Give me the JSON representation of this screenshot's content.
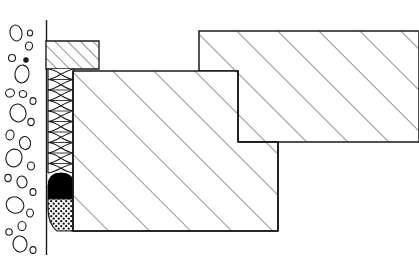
{
  "document": {
    "title": "Construction Joint Section Detail",
    "drawing_type": "architectural-section-detail",
    "width": 419,
    "height": 269,
    "background_color": "#ffffff",
    "line_color": "#1a1a1a"
  },
  "colors": {
    "outline": "#1a1a1a",
    "hatch": "#3a3a3a",
    "sealant_black": "#000000",
    "background": "#ffffff",
    "stipple": "#111111"
  },
  "regions": [
    {
      "id": "aggregate-fill",
      "name": "Aggregate / Gravel Fill",
      "fill_pattern": "pebble-outlines",
      "bounds": {
        "x": 2,
        "y": 22,
        "width": 44,
        "height": 232
      }
    },
    {
      "id": "wall-line",
      "name": "Vertical Wall Reference Line",
      "fill_pattern": "single-line",
      "bounds": {
        "x": 46,
        "y": 20,
        "width": 1,
        "height": 235
      }
    },
    {
      "id": "top-left-block",
      "name": "Upper Left Hatched Member",
      "fill_pattern": "diagonal-hatch-dense",
      "hatch_spacing": 9,
      "hatch_angle": 45,
      "bounds": {
        "x": 46,
        "y": 41,
        "width": 53,
        "height": 28
      }
    },
    {
      "id": "joint-filler",
      "name": "Coiled Joint Filler Strip",
      "fill_pattern": "coil-spring",
      "bounds": {
        "x": 48,
        "y": 69,
        "width": 26,
        "height": 104
      }
    },
    {
      "id": "sealant-bead",
      "name": "Black Sealant Bead",
      "fill_pattern": "solid-black",
      "bounds": {
        "x": 48,
        "y": 173,
        "width": 26,
        "height": 26
      }
    },
    {
      "id": "backer-rod",
      "name": "Stippled Backer Rod",
      "fill_pattern": "cross-stipple",
      "bounds": {
        "x": 48,
        "y": 199,
        "width": 26,
        "height": 32
      }
    },
    {
      "id": "main-block",
      "name": "Main Hatched Concrete Block",
      "fill_pattern": "diagonal-hatch",
      "hatch_spacing": 29,
      "hatch_angle": 45,
      "bounds": {
        "x": 73,
        "y": 71,
        "width": 205,
        "height": 160
      }
    },
    {
      "id": "upper-right-block",
      "name": "Upper Right Hatched Concrete Block",
      "fill_pattern": "diagonal-hatch",
      "hatch_spacing": 29,
      "hatch_angle": 45,
      "bounds": {
        "x": 199,
        "y": 31,
        "width": 220,
        "height": 111
      }
    }
  ],
  "geometry": {
    "wall_line": {
      "x": 46.5,
      "y_top": 20,
      "y_bottom": 255
    },
    "top_left_block_path": "M46,41 L99,41 L99,69 L46,69 Z",
    "filler_strip": {
      "x_left": 48,
      "x_right": 74,
      "y_top": 69,
      "y_bottom": 173
    },
    "sealant_top_y": 173,
    "sealant_bottom_y": 199,
    "backer_bottom_y": 231,
    "main_block_path": "M73,71 L238,71 L238,142 L278,142 L278,231 L73,231 Z",
    "upper_right_block_path": "M199,31 L419,31 L419,142 L238,142 L238,71 L199,71 Z",
    "step_inner_corner": {
      "x": 238,
      "y": 142
    },
    "main_block_right_edge_x": 278,
    "main_block_bottom_y": 231
  },
  "pebbles": [
    {
      "cx": 16,
      "cy": 33,
      "rx": 6,
      "ry": 8,
      "rot": -12
    },
    {
      "cx": 29,
      "cy": 46,
      "rx": 3.5,
      "ry": 4,
      "rot": 10
    },
    {
      "cx": 12,
      "cy": 58,
      "rx": 3.5,
      "ry": 3.5,
      "rot": 0
    },
    {
      "cx": 26,
      "cy": 60,
      "rx": 2.2,
      "ry": 2.2,
      "rot": 0,
      "solid": true
    },
    {
      "cx": 22,
      "cy": 74,
      "rx": 7,
      "ry": 9,
      "rot": 8
    },
    {
      "cx": 10,
      "cy": 93,
      "rx": 4.5,
      "ry": 4,
      "rot": -20
    },
    {
      "cx": 23,
      "cy": 94,
      "rx": 3.8,
      "ry": 3.4,
      "rot": 15
    },
    {
      "cx": 33,
      "cy": 101,
      "rx": 3,
      "ry": 3.4,
      "rot": 0
    },
    {
      "cx": 18,
      "cy": 113,
      "rx": 8,
      "ry": 9,
      "rot": -18
    },
    {
      "cx": 31,
      "cy": 122,
      "rx": 3.2,
      "ry": 3.6,
      "rot": 0
    },
    {
      "cx": 10,
      "cy": 135,
      "rx": 4,
      "ry": 5,
      "rot": 12
    },
    {
      "cx": 25,
      "cy": 143,
      "rx": 5.5,
      "ry": 6.5,
      "rot": -10
    },
    {
      "cx": 14,
      "cy": 158,
      "rx": 8,
      "ry": 9,
      "rot": 20
    },
    {
      "cx": 31,
      "cy": 166,
      "rx": 3.5,
      "ry": 4,
      "rot": 0
    },
    {
      "cx": 8,
      "cy": 178,
      "rx": 3.2,
      "ry": 3.6,
      "rot": 0
    },
    {
      "cx": 22,
      "cy": 182,
      "rx": 5,
      "ry": 6,
      "rot": -14
    },
    {
      "cx": 33,
      "cy": 192,
      "rx": 3,
      "ry": 3.4,
      "rot": 0
    },
    {
      "cx": 15,
      "cy": 205,
      "rx": 9,
      "ry": 8,
      "rot": 25
    },
    {
      "cx": 30,
      "cy": 213,
      "rx": 3.4,
      "ry": 4,
      "rot": 0
    },
    {
      "cx": 22,
      "cy": 226,
      "rx": 4,
      "ry": 4.5,
      "rot": 0
    },
    {
      "cx": 9,
      "cy": 232,
      "rx": 3.2,
      "ry": 3.2,
      "rot": 0
    },
    {
      "cx": 20,
      "cy": 244,
      "rx": 7,
      "ry": 8,
      "rot": -8
    },
    {
      "cx": 33,
      "cy": 250,
      "rx": 3,
      "ry": 3.4,
      "rot": 0
    },
    {
      "cx": 30,
      "cy": 33,
      "rx": 2.6,
      "ry": 3,
      "rot": 0
    }
  ]
}
